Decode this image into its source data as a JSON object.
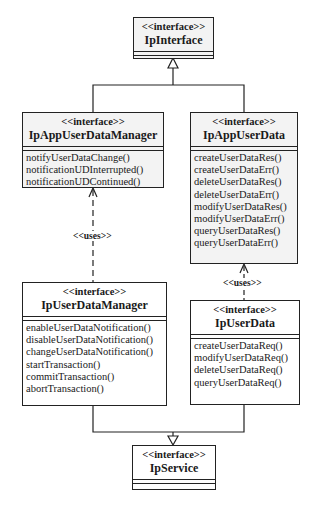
{
  "diagram": {
    "type": "uml-class-diagram",
    "classes": {
      "ip_interface": {
        "stereotype": "<<interface>>",
        "name": "IpInterface",
        "operations": []
      },
      "ip_app_user_data_manager": {
        "stereotype": "<<interface>>",
        "name": "IpAppUserDataManager",
        "operations": [
          "notifyUserDataChange()",
          "notificationUDInterrupted()",
          "notificationUDContinued()"
        ]
      },
      "ip_app_user_data": {
        "stereotype": "<<interface>>",
        "name": "IpAppUserData",
        "operations": [
          "createUserDataRes()",
          "createUserDataErr()",
          "deleteUserDataRes()",
          "deleteUserDataErr()",
          "modifyUserDataRes()",
          "modifyUserDataErr()",
          "queryUserDataRes()",
          "queryUserDataErr()"
        ]
      },
      "ip_user_data_manager": {
        "stereotype": "<<interface>>",
        "name": "IpUserDataManager",
        "operations": [
          "enableUserDataNotification()",
          "disableUserDataNotification()",
          "changeUserDataNotification()",
          "startTransaction()",
          "commitTransaction()",
          "abortTransaction()"
        ]
      },
      "ip_user_data": {
        "stereotype": "<<interface>>",
        "name": "IpUserData",
        "operations": [
          "createUserDataReq()",
          "modifyUserDataReq()",
          "deleteUserDataReq()",
          "queryUserDataReq()"
        ]
      },
      "ip_service": {
        "stereotype": "<<interface>>",
        "name": "IpService",
        "operations": []
      }
    },
    "relations": {
      "uses_left": {
        "label": "<<uses>>",
        "from": "IpUserDataManager",
        "to": "IpAppUserDataManager",
        "kind": "dependency"
      },
      "uses_right": {
        "label": "<<uses>>",
        "from": "IpUserData",
        "to": "IpAppUserData",
        "kind": "dependency"
      },
      "gen_top": {
        "from": [
          "IpAppUserDataManager",
          "IpAppUserData"
        ],
        "to": "IpInterface",
        "kind": "generalization"
      },
      "gen_bottom": {
        "from": [
          "IpUserDataManager",
          "IpUserData"
        ],
        "to": "IpService",
        "kind": "generalization"
      }
    },
    "colors": {
      "line": "#222222",
      "box_fill": "#ffffff",
      "shaded_fill": "#f3f3f3"
    }
  }
}
